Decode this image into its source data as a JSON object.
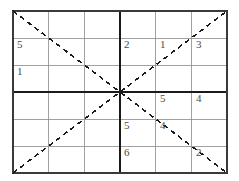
{
  "figure": {
    "type": "grid-puzzle",
    "grid": {
      "columns": 6,
      "rows": 6,
      "block_columns": 3,
      "block_rows": 3,
      "left": 13,
      "top": 11,
      "right": 227,
      "bottom": 173,
      "cell_width": 35.67,
      "cell_height": 27.0,
      "thin_line_color": "#8a8a8a",
      "thin_line_width": 0.8,
      "thick_line_color": "#1a1a1a",
      "thick_line_width": 2.0,
      "border_color": "#3a3a3a",
      "border_width": 1.2
    },
    "diagonals": {
      "color": "#1a1a1a",
      "width": 1.6,
      "dash_pattern": "5,4",
      "lines": [
        {
          "name": "main-diagonal-down",
          "x1": 13,
          "y1": 11,
          "x2": 227,
          "y2": 173
        },
        {
          "name": "anti-diagonal-up",
          "x1": 13,
          "y1": 173,
          "x2": 227,
          "y2": 11
        }
      ],
      "intersection": {
        "x": 120,
        "y": 92
      }
    },
    "number_color": "#4a4a4a",
    "cells": [
      {
        "name": "cell-r2c1",
        "row": 2,
        "col": 1,
        "value": "5",
        "x": 17,
        "y": 39
      },
      {
        "name": "cell-r2c4",
        "row": 2,
        "col": 4,
        "value": "2",
        "x": 124,
        "y": 39
      },
      {
        "name": "cell-r2c5",
        "row": 2,
        "col": 5,
        "value": "1",
        "x": 160,
        "y": 39
      },
      {
        "name": "cell-r2c6",
        "row": 2,
        "col": 6,
        "value": "3",
        "x": 196,
        "y": 39
      },
      {
        "name": "cell-r3c1",
        "row": 3,
        "col": 1,
        "value": "1",
        "x": 17,
        "y": 66
      },
      {
        "name": "cell-r4c5",
        "row": 4,
        "col": 5,
        "value": "5",
        "x": 160,
        "y": 93
      },
      {
        "name": "cell-r4c6",
        "row": 4,
        "col": 6,
        "value": "4",
        "x": 196,
        "y": 93
      },
      {
        "name": "cell-r5c4",
        "row": 5,
        "col": 4,
        "value": "5",
        "x": 124,
        "y": 120
      },
      {
        "name": "cell-r5c5",
        "row": 5,
        "col": 5,
        "value": "4",
        "x": 160,
        "y": 120
      },
      {
        "name": "cell-r6c4",
        "row": 6,
        "col": 4,
        "value": "6",
        "x": 124,
        "y": 147
      },
      {
        "name": "cell-r6c6",
        "row": 6,
        "col": 6,
        "value": "2",
        "x": 196,
        "y": 147
      }
    ]
  },
  "chart_data": {
    "type": "table",
    "categories": [
      "col1",
      "col2",
      "col3",
      "col4",
      "col5",
      "col6"
    ],
    "rows": [
      [
        "",
        "",
        "",
        "",
        "",
        ""
      ],
      [
        "5",
        "",
        "",
        "2",
        "1",
        "3"
      ],
      [
        "1",
        "",
        "",
        "",
        "",
        ""
      ],
      [
        "",
        "",
        "",
        "",
        "5",
        "4"
      ],
      [
        "",
        "",
        "",
        "5",
        "4",
        ""
      ],
      [
        "",
        "",
        "",
        "6",
        "",
        "2"
      ]
    ],
    "annotations": [
      "Two dashed diagonals span corner-to-corner and intersect at the grid center",
      "Thick lines divide the grid into four 3x3 blocks"
    ],
    "xlabel": "",
    "ylabel": ""
  }
}
